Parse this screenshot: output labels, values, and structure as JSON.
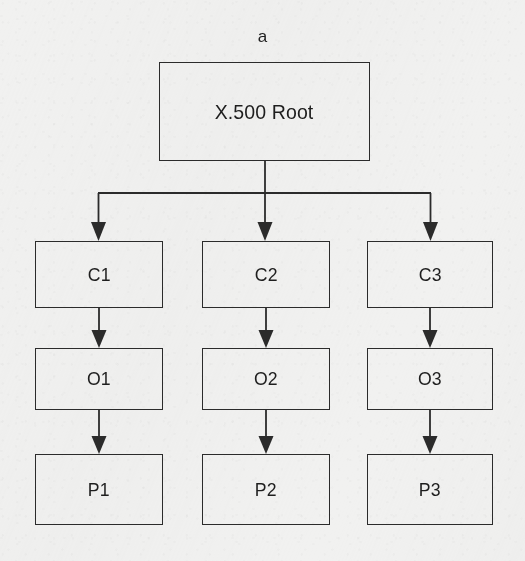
{
  "figure": {
    "caption": "a",
    "background_color": "#f1f1f0",
    "line_color": "#2b2b2b"
  },
  "nodes": {
    "root": {
      "label": "X.500 Root",
      "x": 159,
      "y": 62,
      "w": 211,
      "h": 99
    },
    "c1": {
      "label": "C1",
      "x": 35,
      "y": 241,
      "w": 128,
      "h": 67
    },
    "c2": {
      "label": "C2",
      "x": 202,
      "y": 241,
      "w": 128,
      "h": 67
    },
    "c3": {
      "label": "C3",
      "x": 367,
      "y": 241,
      "w": 126,
      "h": 67
    },
    "o1": {
      "label": "O1",
      "x": 35,
      "y": 348,
      "w": 128,
      "h": 62
    },
    "o2": {
      "label": "O2",
      "x": 202,
      "y": 348,
      "w": 128,
      "h": 62
    },
    "o3": {
      "label": "O3",
      "x": 367,
      "y": 348,
      "w": 126,
      "h": 62
    },
    "p1": {
      "label": "P1",
      "x": 35,
      "y": 454,
      "w": 128,
      "h": 71
    },
    "p2": {
      "label": "P2",
      "x": 202,
      "y": 454,
      "w": 128,
      "h": 71
    },
    "p3": {
      "label": "P3",
      "x": 367,
      "y": 454,
      "w": 126,
      "h": 71
    }
  },
  "edges": [
    {
      "name": "root-to-branch-trunk",
      "from": "root",
      "to": "branch-bar"
    },
    {
      "name": "branch-bar",
      "from": "branch-bar-left",
      "to": "branch-bar-right"
    },
    {
      "name": "branch-to-c1",
      "from": "branch-bar",
      "to": "c1"
    },
    {
      "name": "branch-to-c2",
      "from": "branch-bar",
      "to": "c2"
    },
    {
      "name": "branch-to-c3",
      "from": "branch-bar",
      "to": "c3"
    },
    {
      "name": "c1-to-o1",
      "from": "c1",
      "to": "o1"
    },
    {
      "name": "c2-to-o2",
      "from": "c2",
      "to": "o2"
    },
    {
      "name": "c3-to-o3",
      "from": "c3",
      "to": "o3"
    },
    {
      "name": "o1-to-p1",
      "from": "o1",
      "to": "p1"
    },
    {
      "name": "o2-to-p2",
      "from": "o2",
      "to": "p2"
    },
    {
      "name": "o3-to-p3",
      "from": "o3",
      "to": "p3"
    }
  ]
}
